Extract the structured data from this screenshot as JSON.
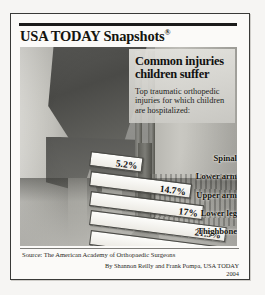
{
  "masthead": {
    "brand": "USA TODAY Snapshots",
    "registered_mark": "®"
  },
  "headline": "Common injuries children suffer",
  "subhead": "Top traumatic orthopedic injuries for which children are hospitalized:",
  "source": "Source: The American Academy of Orthopaedic Surgeons",
  "byline": "By Shannon Reilly and Frank Pompa, USA TODAY",
  "year": "2004",
  "colors": {
    "ink": "#15150f",
    "bar_fill": "#fdfdfb",
    "bar_stroke": "#4a4a46",
    "frame": "#3a3a38"
  },
  "chart_data": {
    "type": "bar",
    "orientation": "horizontal",
    "title": "Common injuries children suffer",
    "subtitle": "Top traumatic orthopedic injuries for which children are hospitalized:",
    "categories": [
      "Spinal",
      "Lower arm",
      "Upper arm",
      "Lower leg",
      "Thighbone"
    ],
    "values": [
      5.2,
      14.7,
      17,
      21.5,
      21.7
    ],
    "value_labels": [
      "5.2%",
      "14.7%",
      "17%",
      "21.5%",
      "21.7%"
    ],
    "xlabel": "",
    "ylabel": "",
    "xlim": [
      0,
      24
    ],
    "grid": false,
    "legend": null,
    "units": "percent",
    "source": "Source: The American Academy of Orthopaedic Surgeons"
  }
}
